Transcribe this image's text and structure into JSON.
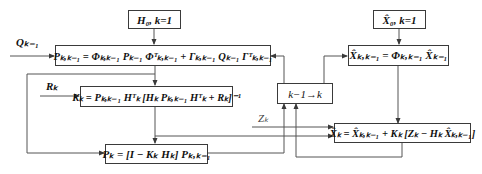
{
  "diagram": {
    "type": "flowchart",
    "boxes": {
      "h0_init": "H₀, k=1",
      "p_predict": "Pₖ,ₖ₋₁ = Φₖ,ₖ₋₁ Pₖ₋₁ Φᵀₖ,ₖ₋₁ + Γₖ,ₖ₋₁ Qₖ₋₁ Γᵀₖ,ₖ₋₁",
      "k_gain": "Kₖ = Pₖ,ₖ₋₁ Hᵀₖ [Hₖ Pₖ,ₖ₋₁ Hᵀₖ + Rₖ]⁻¹",
      "p_update": "Pₖ = [I − Kₖ Hₖ] Pₖ,ₖ₋₁",
      "x0_init": "X̂₀, k=1",
      "x_predict": "X̂ₖ,ₖ₋₁ = Φₖ,ₖ₋₁ X̂ₖ₋₁",
      "step": "k−1→k",
      "x_update": "X̂ₖ = X̂ₖ,ₖ₋₁ + Kₖ [Zₖ − Hₖ X̂ₖ,ₖ₋₁]"
    },
    "inputs": {
      "q": "Qₖ₋₁",
      "r": "Rₖ",
      "z": "Zₖ"
    },
    "colors": {
      "line": "#3a3a3a",
      "text": "#111111",
      "background": "#ffffff"
    }
  }
}
